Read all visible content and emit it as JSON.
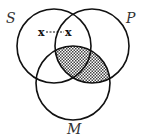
{
  "diagram": {
    "type": "venn-3-syllogism",
    "circles": [
      {
        "id": "S",
        "label": "S",
        "cx": 54,
        "cy": 46,
        "r": 37
      },
      {
        "id": "P",
        "label": "P",
        "cx": 92,
        "cy": 46,
        "r": 37
      },
      {
        "id": "M",
        "label": "M",
        "cx": 73,
        "cy": 83,
        "r": 37
      }
    ],
    "shaded_region": "M ∩ P (including S ∩ M ∩ P)",
    "x_marks": {
      "left": "x",
      "right": "x",
      "note": "x straddles the S∩P line outside M (dotted connector)"
    },
    "colors": {
      "stroke": "#111111",
      "shade": "#555555",
      "background": "#ffffff"
    }
  },
  "labels": {
    "S": "S",
    "P": "P",
    "M": "M"
  }
}
